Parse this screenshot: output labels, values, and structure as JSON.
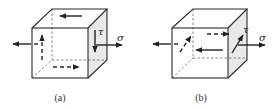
{
  "figure": {
    "panels": [
      {
        "id": "a",
        "caption": "(a)",
        "shear_label": "τ",
        "normal_label": "σ",
        "description": "Cube with normal stress σ on left/right faces and shear stress τ acting vertically on the right face; shear arrows on top (left-pointing), back (up, dashed) and bottom (right, dashed) faces"
      },
      {
        "id": "b",
        "caption": "(b)",
        "shear_label": "τ",
        "normal_label": "σ",
        "description": "Cube with normal stress σ on left/right faces and shear stress τ acting diagonally in the right face plane; horizontal shear arrows on front (left-pointing) and back (right, dashed) faces"
      }
    ],
    "colors": {
      "edge": "#2a2a2a",
      "shaded_face": "#e9e9e9",
      "background": "#ffffff"
    }
  }
}
